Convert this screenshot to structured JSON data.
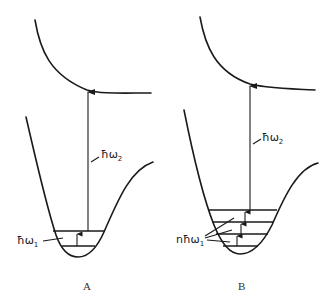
{
  "figure": {
    "panels": [
      {
        "id": "A",
        "label": "A",
        "excitation_label": "ħω",
        "excitation_sub": "2",
        "vibrational_label": "ħω",
        "vibrational_sub": "1",
        "vibrational_levels": 2
      },
      {
        "id": "B",
        "label": "B",
        "excitation_label": "ħω",
        "excitation_sub": "2",
        "vibrational_label": "nħω",
        "vibrational_sub": "1",
        "vibrational_levels": 4
      }
    ],
    "colors": {
      "line": "#1a1a1a",
      "background": "#ffffff"
    }
  }
}
